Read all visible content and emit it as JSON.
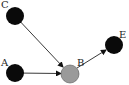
{
  "diagram": {
    "type": "directed-graph",
    "nodes": [
      {
        "id": "C",
        "label": "C",
        "x": 15,
        "y": 16,
        "r": 9,
        "fill": "#0a0a0a"
      },
      {
        "id": "A",
        "label": "A",
        "x": 15,
        "y": 73,
        "r": 9,
        "fill": "#0a0a0a"
      },
      {
        "id": "B",
        "label": "B",
        "x": 70,
        "y": 74,
        "r": 9,
        "fill": "#9a9a9a"
      },
      {
        "id": "E",
        "label": "E",
        "x": 114,
        "y": 45,
        "r": 9,
        "fill": "#0a0a0a"
      }
    ],
    "edges": [
      {
        "from": "C",
        "to": "B"
      },
      {
        "from": "A",
        "to": "B"
      },
      {
        "from": "B",
        "to": "E"
      }
    ],
    "labels": {
      "C": "C",
      "A": "A",
      "B": "B",
      "E": "E"
    }
  }
}
